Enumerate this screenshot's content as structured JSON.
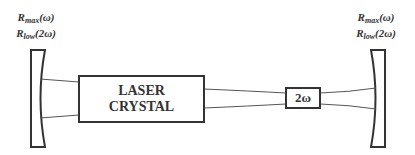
{
  "diagram": {
    "type": "laser-cavity-intracavity-frequency-doubling",
    "left_mirror": {
      "label_line1_main": "R",
      "label_line1_sub": "max",
      "label_line1_arg": "(ω)",
      "label_line2_main": "R",
      "label_line2_sub": "low",
      "label_line2_arg": "(2ω)"
    },
    "right_mirror": {
      "label_line1_main": "R",
      "label_line1_sub": "max",
      "label_line1_arg": "(ω)",
      "label_line2_main": "R",
      "label_line2_sub": "low",
      "label_line2_arg": "(2ω)"
    },
    "laser_crystal": {
      "line1": "LASER",
      "line2": "CRYSTAL"
    },
    "doubler": {
      "label": "2ω"
    },
    "colors": {
      "stroke": "#333333",
      "beam": "#555555",
      "background": "#ffffff"
    }
  }
}
